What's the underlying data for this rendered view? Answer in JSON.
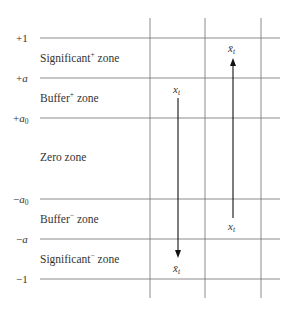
{
  "diagram": {
    "levels": [
      {
        "label": "+1",
        "y": 38
      },
      {
        "label": "+a",
        "y": 78
      },
      {
        "label": "+a0",
        "y": 118
      },
      {
        "label": "−a0",
        "y": 199
      },
      {
        "label": "−a",
        "y": 239
      },
      {
        "label": "−1",
        "y": 279
      }
    ],
    "level_labels": {
      "plus_one": "+1",
      "plus_a_sign": "+",
      "plus_a_var": "a",
      "plus_a0_sign": "+",
      "plus_a0_var": "a",
      "plus_a0_sub": "0",
      "minus_a0_sign": "−",
      "minus_a0_var": "a",
      "minus_a0_sub": "0",
      "minus_a_sign": "−",
      "minus_a_var": "a",
      "minus_one": "−1"
    },
    "zones": {
      "significant_plus": {
        "name": "Significant",
        "sup": "+",
        "suffix": " zone"
      },
      "buffer_plus": {
        "name": "Buffer",
        "sup": "+",
        "suffix": " zone"
      },
      "zero": {
        "name": "Zero zone"
      },
      "buffer_minus": {
        "name": "Buffer",
        "sup": "−",
        "suffix": " zone"
      },
      "significant_minus": {
        "name": "Significant",
        "sup": "−",
        "suffix": " zone"
      }
    },
    "arrows": [
      {
        "direction": "down",
        "from_label": "x",
        "from_sub": "t",
        "to_label": "x̄",
        "to_sub": "t"
      },
      {
        "direction": "up",
        "from_label": "x",
        "from_sub": "t",
        "to_label": "x̄",
        "to_sub": "t"
      }
    ],
    "colors": {
      "grid": "#6e6e6e",
      "arrow": "#111111",
      "text": "#333333"
    }
  }
}
